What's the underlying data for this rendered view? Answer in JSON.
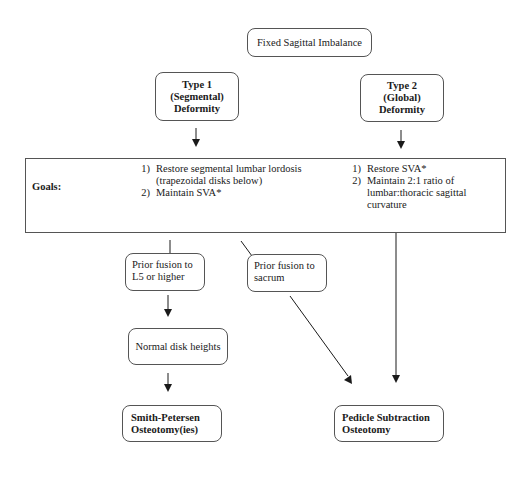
{
  "diagram": {
    "root": {
      "label": "Fixed Sagittal Imbalance"
    },
    "type1": {
      "lines": [
        "Type 1",
        "(Segmental)",
        "Deformity"
      ]
    },
    "type2": {
      "lines": [
        "Type 2",
        "(Global)",
        "Deformity"
      ]
    },
    "goals": {
      "label": "Goals:",
      "type1_goals": [
        {
          "num": "1)",
          "text": "Restore segmental lumbar lordosis (trapezoidal disks below)"
        },
        {
          "num": "2)",
          "text": "Maintain SVA*"
        }
      ],
      "type2_goals": [
        {
          "num": "1)",
          "text": "Restore SVA*"
        },
        {
          "num": "2)",
          "text": "Maintain 2:1 ratio of lumbar:thoracic sagittal curvature"
        }
      ]
    },
    "prior_fusion_l5": {
      "label": "Prior fusion to L5 or higher"
    },
    "prior_fusion_sacrum": {
      "label": "Prior fusion to sacrum"
    },
    "normal_disk": {
      "label": "Normal disk heights"
    },
    "spo": {
      "lines": [
        "Smith-Petersen",
        "Osteotomy(ies)"
      ]
    },
    "pso": {
      "lines": [
        "Pedicle Subtraction",
        "Osteotomy"
      ]
    },
    "colors": {
      "line": "#1a1a1a",
      "border": "#555555",
      "background": "#ffffff"
    }
  }
}
